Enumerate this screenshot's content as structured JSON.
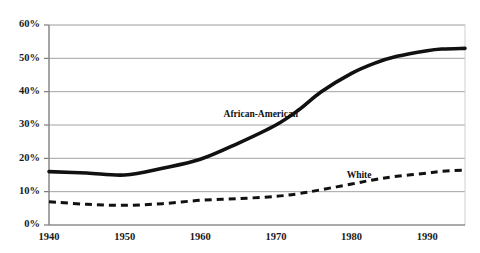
{
  "chart_data": {
    "type": "line",
    "title": "",
    "xlabel": "",
    "ylabel": "",
    "xlim": [
      1940,
      1995
    ],
    "ylim": [
      0,
      60
    ],
    "grid": true,
    "legend_position": "inline-annotation",
    "x_tick_labels": [
      "1940",
      "1950",
      "1960",
      "1970",
      "1980",
      "1990"
    ],
    "x_ticks": [
      1940,
      1950,
      1960,
      1970,
      1980,
      1990
    ],
    "y_tick_labels": [
      "0%",
      "10%",
      "20%",
      "30%",
      "40%",
      "50%",
      "60%"
    ],
    "y_ticks": [
      0,
      10,
      20,
      30,
      40,
      50,
      60
    ],
    "series": [
      {
        "name": "African-American",
        "style": "solid",
        "color": "#111111",
        "annotation": "African-American",
        "annotation_x": 1968,
        "annotation_y": 33,
        "x": [
          1940,
          1945,
          1950,
          1955,
          1960,
          1965,
          1970,
          1973,
          1976,
          1980,
          1983,
          1986,
          1990,
          1992,
          1995
        ],
        "values": [
          16,
          15.6,
          15,
          17,
          19.7,
          24.5,
          30,
          34.5,
          40,
          45.5,
          48.5,
          50.6,
          52.3,
          52.8,
          53
        ]
      },
      {
        "name": "White",
        "style": "dashed",
        "color": "#111111",
        "annotation": "White",
        "annotation_x": 1981,
        "annotation_y": 14.8,
        "x": [
          1940,
          1945,
          1950,
          1955,
          1960,
          1965,
          1970,
          1973,
          1976,
          1980,
          1983,
          1986,
          1990,
          1992,
          1995
        ],
        "values": [
          7,
          6.2,
          5.9,
          6.4,
          7.4,
          7.9,
          8.6,
          9.4,
          10.6,
          12.3,
          13.6,
          14.6,
          15.6,
          16.1,
          16.5
        ]
      }
    ]
  },
  "colors": {
    "background": "#ffffff",
    "gridline": "#9a9a9a",
    "axis": "#6f6f6f",
    "series": "#111111"
  }
}
